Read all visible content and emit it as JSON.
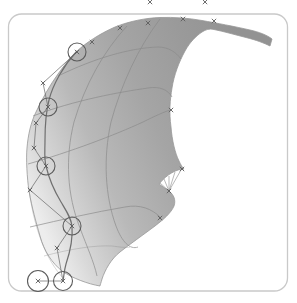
{
  "viewport": {
    "background": "#ffffff",
    "panel": {
      "fill": "#ffffff",
      "border_color": "#c9c9c9",
      "shadow_color": "#e4e4e4"
    },
    "surface": {
      "gradient": [
        "#ededed",
        "#d9d9d9",
        "#b9b9b9",
        "#a5a5a5",
        "#9a9a9a",
        "#929292"
      ],
      "outline_color": "#979797",
      "isocurve_color": "#8a8a8a",
      "edge_curve_color": "#6f6f6f"
    },
    "markers": {
      "color": "#5c5c5c",
      "polygon_color": "#6a6a6a",
      "fan_color": "#8f8f8f",
      "circle_radius": 9,
      "circles": [
        {
          "cx": 77,
          "cy": 52
        },
        {
          "cx": 48,
          "cy": 107
        },
        {
          "cx": 46,
          "cy": 166
        },
        {
          "cx": 72,
          "cy": 226
        },
        {
          "cx": 38,
          "cy": 281,
          "r": 10.5
        },
        {
          "cx": 63,
          "cy": 281,
          "r": 9.5
        }
      ],
      "crosses": [
        {
          "x": 92,
          "y": 42
        },
        {
          "x": 120,
          "y": 28
        },
        {
          "x": 148,
          "y": 23
        },
        {
          "x": 183,
          "y": 19
        },
        {
          "x": 214,
          "y": 21
        },
        {
          "x": 171,
          "y": 110
        },
        {
          "x": 182,
          "y": 169
        },
        {
          "x": 169,
          "y": 191
        },
        {
          "x": 160,
          "y": 218
        },
        {
          "x": 43,
          "y": 83
        },
        {
          "x": 36,
          "y": 123
        },
        {
          "x": 34,
          "y": 148
        },
        {
          "x": 30,
          "y": 190
        },
        {
          "x": 57,
          "y": 248
        },
        {
          "x": 77,
          "y": 52
        },
        {
          "x": 48,
          "y": 107
        },
        {
          "x": 46,
          "y": 166
        },
        {
          "x": 72,
          "y": 226
        },
        {
          "x": 38,
          "y": 281
        },
        {
          "x": 63,
          "y": 281
        }
      ],
      "clipped_crosses": [
        {
          "x": 150,
          "y": 2
        },
        {
          "x": 205,
          "y": 2
        }
      ],
      "polygon_segments": [
        [
          77,
          52,
          43,
          83
        ],
        [
          43,
          83,
          48,
          107
        ],
        [
          48,
          107,
          36,
          123
        ],
        [
          36,
          123,
          34,
          148
        ],
        [
          34,
          148,
          46,
          166
        ],
        [
          46,
          166,
          30,
          190
        ],
        [
          30,
          190,
          72,
          226
        ],
        [
          72,
          226,
          57,
          248
        ],
        [
          57,
          248,
          63,
          281
        ],
        [
          38,
          281,
          63,
          281
        ]
      ],
      "fan": {
        "apex": [
          169,
          191
        ],
        "tips": [
          [
            160,
            183
          ],
          [
            164,
            179
          ],
          [
            169,
            176
          ],
          [
            175,
            172
          ],
          [
            181,
            170
          ]
        ]
      }
    }
  }
}
